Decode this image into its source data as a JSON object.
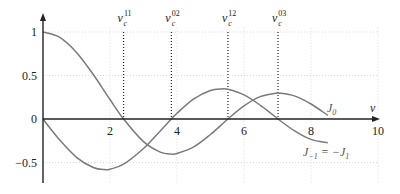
{
  "chart_data": {
    "type": "line",
    "title": "",
    "xlabel": "v",
    "ylabel": "",
    "xlim": [
      0,
      10
    ],
    "ylim": [
      -0.75,
      1.15
    ],
    "grid": true,
    "x_ticks": [
      2,
      4,
      6,
      8,
      10
    ],
    "x_tick_labels": [
      "2",
      "4",
      "6",
      "8",
      "10"
    ],
    "y_ticks": [
      1,
      0.5,
      0,
      -0.5
    ],
    "y_tick_labels": [
      "1",
      "0.5",
      "0",
      "−0.5"
    ],
    "series": [
      {
        "name": "J0",
        "label": "J₀",
        "color": "#7a7a7a",
        "x": [
          0,
          0.5,
          1,
          1.5,
          2,
          2.405,
          3,
          3.5,
          3.832,
          4,
          4.5,
          5,
          5.52,
          6,
          6.5,
          7,
          7.016,
          7.5,
          8,
          8.5
        ],
        "values": [
          1.0,
          0.938,
          0.765,
          0.512,
          0.224,
          0.0,
          -0.26,
          -0.38,
          -0.403,
          -0.397,
          -0.321,
          -0.178,
          0.0,
          0.151,
          0.26,
          0.3,
          0.3,
          0.266,
          0.172,
          0.042
        ]
      },
      {
        "name": "J-1 = -J1",
        "label": "J₋₁ = −J₁",
        "color": "#7a7a7a",
        "x": [
          0,
          0.5,
          1,
          1.5,
          1.841,
          2,
          2.405,
          3,
          3.5,
          3.832,
          4,
          4.5,
          5,
          5.331,
          5.52,
          6,
          6.5,
          7,
          7.016,
          7.5,
          8,
          8.5
        ],
        "values": [
          0.0,
          -0.242,
          -0.44,
          -0.558,
          -0.582,
          -0.577,
          -0.52,
          -0.339,
          -0.137,
          0.0,
          0.066,
          0.231,
          0.328,
          0.346,
          0.341,
          0.277,
          0.154,
          0.005,
          0.0,
          -0.135,
          -0.235,
          -0.273
        ]
      }
    ],
    "vertical_markers": [
      {
        "label": "ν_c^11",
        "base": "ν",
        "sub": "c",
        "sup": "11",
        "x": 2.405
      },
      {
        "label": "ν_c^02",
        "base": "ν",
        "sub": "c",
        "sup": "02",
        "x": 3.832
      },
      {
        "label": "ν_c^12",
        "base": "ν",
        "sub": "c",
        "sup": "12",
        "x": 5.52
      },
      {
        "label": "ν_c^03",
        "base": "ν",
        "sub": "c",
        "sup": "03",
        "x": 7.016
      }
    ],
    "annotations": [
      {
        "text": "J₀",
        "x": 8.6,
        "y": 0.1
      },
      {
        "text": "J₋₁ = −J₁",
        "x": 8.6,
        "y": -0.35
      }
    ]
  }
}
